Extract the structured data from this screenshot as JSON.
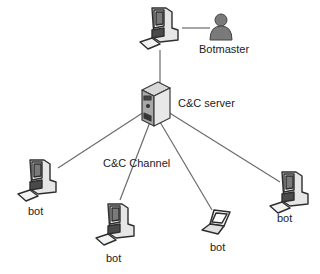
{
  "diagram": {
    "nodes": [
      {
        "id": "botmaster-pc",
        "type": "workstation",
        "label": ""
      },
      {
        "id": "botmaster",
        "type": "person",
        "label": "Botmaster"
      },
      {
        "id": "cc-server",
        "type": "server",
        "label": "C&C server"
      },
      {
        "id": "bot-left",
        "type": "workstation",
        "label": "bot"
      },
      {
        "id": "bot-middle",
        "type": "workstation",
        "label": "bot"
      },
      {
        "id": "bot-laptop",
        "type": "laptop",
        "label": "bot"
      },
      {
        "id": "bot-right",
        "type": "workstation",
        "label": "bot"
      }
    ],
    "edges": [
      {
        "from": "botmaster-pc",
        "to": "botmaster"
      },
      {
        "from": "botmaster-pc",
        "to": "cc-server"
      },
      {
        "from": "cc-server",
        "to": "bot-left"
      },
      {
        "from": "cc-server",
        "to": "bot-middle"
      },
      {
        "from": "cc-server",
        "to": "bot-laptop"
      },
      {
        "from": "cc-server",
        "to": "bot-right"
      }
    ],
    "channel_label": "C&C Channel"
  },
  "colors": {
    "line": "#6b6b6b",
    "icon_dark": "#3a3a3a",
    "icon_mid": "#9a9a9a",
    "icon_light": "#e6e6e6",
    "person": "#7a7a7a"
  }
}
